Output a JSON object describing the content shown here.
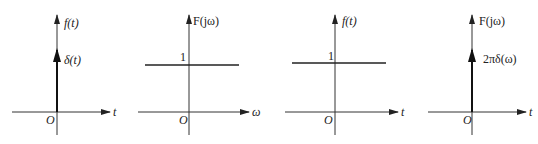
{
  "figure": {
    "panels": [
      {
        "id": "panel-1",
        "y_label": "f(t)",
        "x_label": "t",
        "origin_label": "O",
        "impulse_label": "δ(t)",
        "description": "Unit impulse δ(t) at origin"
      },
      {
        "id": "panel-2",
        "y_label": "F(jω)",
        "x_label": "ω",
        "origin_label": "O",
        "level_label": "1",
        "description": "Constant spectrum F(jω)=1"
      },
      {
        "id": "panel-3",
        "y_label": "f(t)",
        "x_label": "t",
        "origin_label": "O",
        "level_label": "1",
        "description": "Constant signal f(t)=1"
      },
      {
        "id": "panel-4",
        "y_label": "F(jω)",
        "x_label": "t",
        "origin_label": "O",
        "impulse_label": "2πδ(ω)",
        "description": "Impulse spectrum 2πδ(ω) at origin"
      }
    ]
  },
  "colors": {
    "line": "#222222",
    "background": "#ffffff"
  }
}
